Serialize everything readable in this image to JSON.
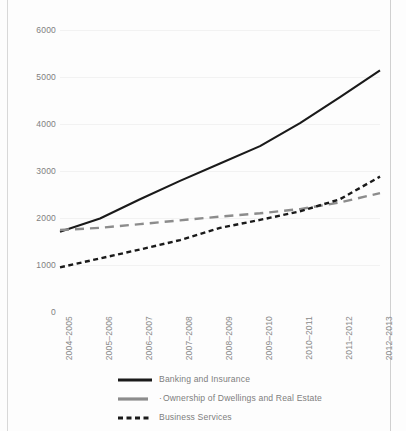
{
  "chart_data": {
    "type": "line",
    "title": "",
    "xlabel": "",
    "ylabel": "",
    "ylim": [
      0,
      6000
    ],
    "yticks": [
      0,
      1000,
      2000,
      3000,
      4000,
      5000,
      6000
    ],
    "grid": true,
    "legend_position": "bottom",
    "categories": [
      "2004–2005",
      "2005–2006",
      "2006–2007",
      "2007–2008",
      "2008–2009",
      "2009–2010",
      "2010–2011",
      "2011–2012",
      "2012–2013"
    ],
    "series": [
      {
        "name": "Banking and Insurance",
        "style": "solid",
        "color": "#1a1a1a",
        "values": [
          1710,
          1990,
          2400,
          2790,
          3160,
          3530,
          4020,
          4570,
          5140
        ]
      },
      {
        "name": "Ownership of Dwellings and Real Estate",
        "style": "dashed",
        "color": "#8c8c8c",
        "values": [
          1745,
          1790,
          1870,
          1950,
          2030,
          2100,
          2190,
          2330,
          2530
        ]
      },
      {
        "name": "Business Services",
        "style": "dotted-dash",
        "color": "#1a1a1a",
        "values": [
          950,
          1140,
          1330,
          1530,
          1790,
          1960,
          2140,
          2400,
          2880
        ]
      }
    ]
  },
  "legend": {
    "items": [
      {
        "label": "Banking and Insurance",
        "marker": "",
        "style": "solid",
        "color": "#1a1a1a"
      },
      {
        "label": "Ownership of Dwellings and Real Estate",
        "marker": "·",
        "style": "dashed",
        "color": "#8c8c8c"
      },
      {
        "label": "Business Services",
        "marker": "",
        "style": "dotted-dash",
        "color": "#1a1a1a"
      }
    ]
  }
}
